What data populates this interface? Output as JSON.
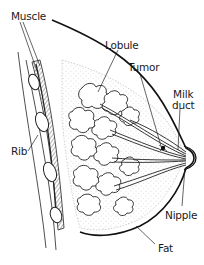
{
  "diagram": {
    "labels": {
      "muscle": "Muscle",
      "lobule": "Lobule",
      "tumor": "Tumor",
      "milk_duct_line1": "Milk",
      "milk_duct_line2": "duct",
      "rib": "Rib",
      "nipple": "Nipple",
      "fat": "Fat"
    },
    "colors": {
      "ink": "#1a1a1a",
      "background": "#ffffff"
    }
  }
}
